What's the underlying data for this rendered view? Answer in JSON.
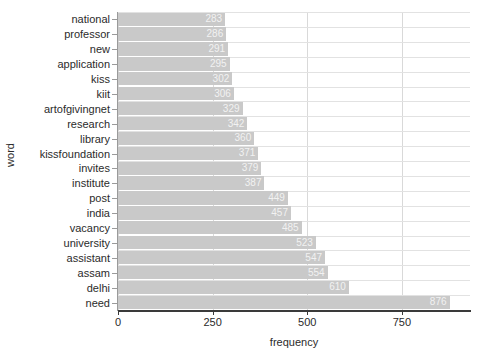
{
  "chart_data": {
    "type": "bar",
    "orientation": "horizontal",
    "title": "",
    "xlabel": "frequency",
    "ylabel": "word",
    "categories": [
      "national",
      "professor",
      "new",
      "application",
      "kiss",
      "kiit",
      "artofgivingnet",
      "research",
      "library",
      "kissfoundation",
      "invites",
      "institute",
      "post",
      "india",
      "vacancy",
      "university",
      "assistant",
      "assam",
      "delhi",
      "need"
    ],
    "values": [
      283,
      286,
      291,
      295,
      302,
      306,
      329,
      342,
      360,
      371,
      379,
      387,
      449,
      457,
      485,
      523,
      547,
      554,
      610,
      876
    ],
    "xlim": [
      0,
      930
    ],
    "xticks": [
      0,
      250,
      500,
      750
    ],
    "xticklabels": [
      "0",
      "250",
      "500",
      "750"
    ],
    "grid": true,
    "legend": null,
    "bar_color": "#c9c9c9",
    "bar_label_color": "#f2f2f2",
    "axis_color": "#3a3a3a",
    "grid_color": "#d9d9d9",
    "background": "#ffffff"
  }
}
